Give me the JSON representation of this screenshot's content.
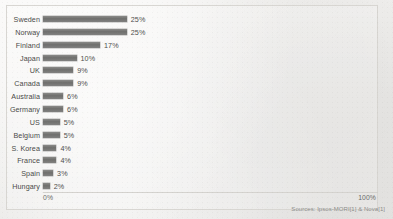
{
  "chart_data": {
    "type": "bar",
    "orientation": "horizontal",
    "title": "",
    "xlabel": "",
    "ylabel": "",
    "xlim": [
      0,
      100
    ],
    "grid": false,
    "legend": null,
    "value_suffix": "%",
    "categories": [
      "Sweden",
      "Norway",
      "Finland",
      "Japan",
      "UK",
      "Canada",
      "Australia",
      "Germany",
      "US",
      "Belgium",
      "S. Korea",
      "France",
      "Spain",
      "Hungary"
    ],
    "values": [
      25,
      25,
      17,
      10,
      9,
      9,
      6,
      6,
      5,
      5,
      4,
      4,
      3,
      2
    ],
    "value_labels": [
      "25%",
      "25%",
      "17%",
      "10%",
      "9%",
      "9%",
      "6%",
      "6%",
      "5%",
      "5%",
      "4%",
      "4%",
      "3%",
      "2%"
    ],
    "axis_ticks": [
      "0%",
      "100%"
    ],
    "bar_color": "#7a7a78",
    "source": "Sources: Ipsos-MORI[1] & Nova[1]"
  },
  "axis": {
    "min_label": "0%",
    "max_label": "100%"
  },
  "footer": {
    "source_note": "Sources: Ipsos-MORI[1] & Nova[1]"
  }
}
